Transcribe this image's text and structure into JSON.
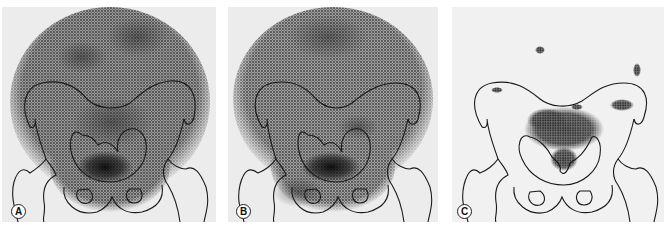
{
  "figure": {
    "panels": [
      {
        "id": "A",
        "label": "A",
        "description": "diffuse tracer activity over abdomen and pelvis with dense focus in pelvic inlet"
      },
      {
        "id": "B",
        "label": "B",
        "description": "diffuse tracer activity with dense focus lower in pelvis"
      },
      {
        "id": "C",
        "label": "C",
        "description": "focal tracer cluster in pelvic inlet, sparse scattered dots elsewhere"
      }
    ],
    "colors": {
      "background": "#ffffff",
      "panel_bg": "#ececec",
      "panel_c_bg": "#f1f1f1",
      "outline": "#1a1a1a",
      "activity_dark": "#1e1e1e",
      "activity_mid": "#6a6a6a"
    }
  }
}
